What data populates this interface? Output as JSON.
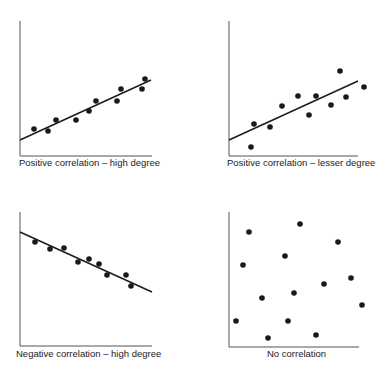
{
  "chart_data": [
    {
      "type": "scatter",
      "title": "Positive correlation – high degree",
      "xlabel": "",
      "ylabel": "",
      "grid": false,
      "trendline": {
        "x1": 20,
        "y1": 140,
        "x2": 151,
        "y2": 80
      },
      "points": [
        [
          34,
          129
        ],
        [
          48,
          131
        ],
        [
          56,
          120
        ],
        [
          76,
          120
        ],
        [
          89,
          111
        ],
        [
          96,
          101
        ],
        [
          117,
          101
        ],
        [
          121,
          89
        ],
        [
          142,
          89
        ],
        [
          145,
          79
        ]
      ]
    },
    {
      "type": "scatter",
      "title": "Positive correlation – lesser degree",
      "xlabel": "",
      "ylabel": "",
      "grid": false,
      "trendline": {
        "x1": 229,
        "y1": 140,
        "x2": 358,
        "y2": 81
      },
      "points": [
        [
          251,
          147
        ],
        [
          254,
          124
        ],
        [
          270,
          127
        ],
        [
          282,
          106
        ],
        [
          298,
          96
        ],
        [
          309,
          115
        ],
        [
          316,
          96
        ],
        [
          331,
          105
        ],
        [
          340,
          71
        ],
        [
          346,
          97
        ],
        [
          364,
          87
        ]
      ]
    },
    {
      "type": "scatter",
      "title": "Negative correlation – high degree",
      "xlabel": "",
      "ylabel": "",
      "grid": false,
      "trendline": {
        "x1": 20,
        "y1": 232,
        "x2": 152,
        "y2": 292
      },
      "points": [
        [
          35,
          242
        ],
        [
          50,
          249
        ],
        [
          64,
          248
        ],
        [
          78,
          262
        ],
        [
          89,
          259
        ],
        [
          99,
          264
        ],
        [
          107,
          275
        ],
        [
          126,
          275
        ],
        [
          131,
          286
        ]
      ]
    },
    {
      "type": "scatter",
      "title": "No correlation",
      "xlabel": "",
      "ylabel": "",
      "grid": false,
      "trendline": null,
      "points": [
        [
          236,
          321
        ],
        [
          243,
          265
        ],
        [
          249,
          232
        ],
        [
          262,
          298
        ],
        [
          268,
          338
        ],
        [
          285,
          256
        ],
        [
          288,
          321
        ],
        [
          294,
          293
        ],
        [
          300,
          224
        ],
        [
          316,
          335
        ],
        [
          324,
          284
        ],
        [
          338,
          242
        ],
        [
          351,
          278
        ],
        [
          362,
          305
        ]
      ]
    }
  ],
  "panels": [
    {
      "label": "Positive correlation – high degree"
    },
    {
      "label": "Positive correlation – lesser degree"
    },
    {
      "label": "Negative correlation – high degree"
    },
    {
      "label": "No correlation"
    }
  ],
  "colors": {
    "ink": "#1a1a1a"
  }
}
